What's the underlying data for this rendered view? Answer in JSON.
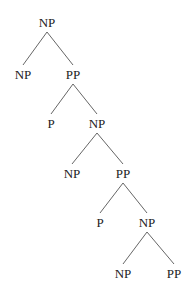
{
  "diagram": {
    "type": "syntax-tree",
    "nodes": [
      {
        "id": "n0",
        "label": "NP",
        "x": 47,
        "y": 27
      },
      {
        "id": "n1",
        "label": "NP",
        "x": 23,
        "y": 79
      },
      {
        "id": "n2",
        "label": "PP",
        "x": 73,
        "y": 79
      },
      {
        "id": "n3",
        "label": "P",
        "x": 51,
        "y": 128
      },
      {
        "id": "n4",
        "label": "NP",
        "x": 97,
        "y": 128
      },
      {
        "id": "n5",
        "label": "NP",
        "x": 72,
        "y": 178
      },
      {
        "id": "n6",
        "label": "PP",
        "x": 123,
        "y": 178
      },
      {
        "id": "n7",
        "label": "P",
        "x": 100,
        "y": 227
      },
      {
        "id": "n8",
        "label": "NP",
        "x": 147,
        "y": 227
      },
      {
        "id": "n9",
        "label": "NP",
        "x": 123,
        "y": 278
      },
      {
        "id": "n10",
        "label": "PP",
        "x": 174,
        "y": 278
      }
    ],
    "edges": [
      {
        "from": "n0",
        "to": "n1"
      },
      {
        "from": "n0",
        "to": "n2"
      },
      {
        "from": "n2",
        "to": "n3"
      },
      {
        "from": "n2",
        "to": "n4"
      },
      {
        "from": "n4",
        "to": "n5"
      },
      {
        "from": "n4",
        "to": "n6"
      },
      {
        "from": "n6",
        "to": "n7"
      },
      {
        "from": "n6",
        "to": "n8"
      },
      {
        "from": "n8",
        "to": "n9"
      },
      {
        "from": "n8",
        "to": "n10"
      }
    ],
    "colors": {
      "text": "#222222",
      "edge": "#666666",
      "background": "#ffffff"
    }
  }
}
